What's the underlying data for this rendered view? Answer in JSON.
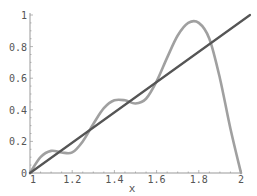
{
  "chart_data": {
    "type": "line",
    "title": "",
    "xlabel": "x",
    "ylabel": "",
    "xlim": [
      1,
      2
    ],
    "ylim": [
      0,
      1
    ],
    "x_ticks": [
      "1",
      "1.2",
      "1.4",
      "1.6",
      "1.8",
      "2"
    ],
    "y_ticks": [
      "0",
      "0.2",
      "0.4",
      "0.6",
      "0.8",
      "1"
    ],
    "grid": false,
    "legend": null,
    "series": [
      {
        "name": "line",
        "color": "#555555",
        "x": [
          1,
          2
        ],
        "y": [
          0,
          1
        ]
      },
      {
        "name": "approximation",
        "color": "#a0a0a0",
        "x": [
          1.0,
          1.05,
          1.1,
          1.15,
          1.2,
          1.25,
          1.3,
          1.35,
          1.4,
          1.45,
          1.5,
          1.55,
          1.6,
          1.65,
          1.7,
          1.75,
          1.8,
          1.85,
          1.9,
          1.95,
          2.0
        ],
        "y": [
          0.0,
          0.1,
          0.14,
          0.13,
          0.13,
          0.2,
          0.31,
          0.41,
          0.46,
          0.46,
          0.44,
          0.47,
          0.58,
          0.73,
          0.87,
          0.95,
          0.95,
          0.85,
          0.6,
          0.28,
          0.0
        ]
      }
    ]
  }
}
